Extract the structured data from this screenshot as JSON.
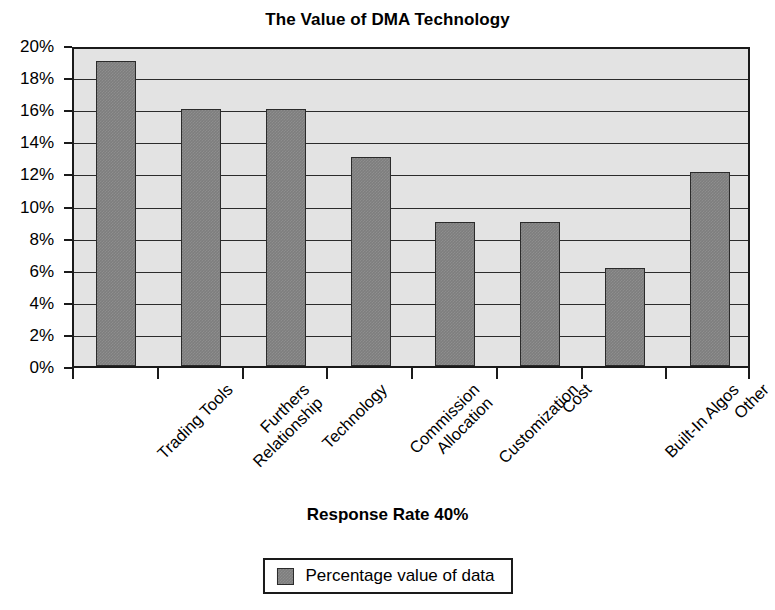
{
  "chart_data": {
    "type": "bar",
    "title": "The Value of DMA Technology",
    "xlabel": "",
    "ylabel": "",
    "ylim": [
      0,
      20
    ],
    "ytick_labels": [
      "20%",
      "18%",
      "16%",
      "14%",
      "12%",
      "10%",
      "8%",
      "6%",
      "4%",
      "2%",
      "0%"
    ],
    "ytick_values": [
      20,
      18,
      16,
      14,
      12,
      10,
      8,
      6,
      4,
      2,
      0
    ],
    "grid": true,
    "legend_position": "bottom",
    "categories": [
      "Trading Tools",
      "Furthers Relationship",
      "Technology",
      "Commission Allocation",
      "Customization",
      "Cost",
      "Built-In Algos",
      "Other"
    ],
    "category_lines": [
      [
        "Trading Tools"
      ],
      [
        "Furthers",
        "Relationship"
      ],
      [
        "Technology"
      ],
      [
        "Commission",
        "Allocation"
      ],
      [
        "Customization"
      ],
      [
        "Cost"
      ],
      [
        "Built-In Algos"
      ],
      [
        "Other"
      ]
    ],
    "series": [
      {
        "name": "Percentage value of data",
        "values": [
          19,
          16,
          16,
          13,
          9,
          9,
          6.1,
          12.1
        ]
      }
    ],
    "annotations": [
      "Response Rate 40%"
    ],
    "colors": {
      "bar_fill": "#7e7e7e",
      "bar_border": "#2b2b2b",
      "plot_background": "#e3e3e3",
      "gridline": "#2b2b2b",
      "axis": "#1a1a1a",
      "text": "#000000",
      "page_background": "#ffffff"
    }
  },
  "footer": {
    "response_rate": "Response Rate 40%"
  },
  "legend": {
    "entries": [
      {
        "label": "Percentage value of data",
        "swatch_name": "legend-swatch-percentage-value"
      }
    ]
  }
}
